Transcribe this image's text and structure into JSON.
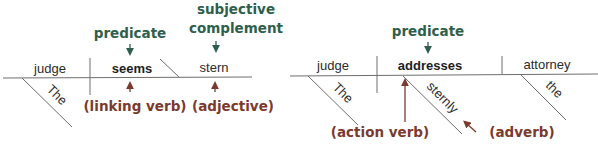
{
  "colors": {
    "label_green": "#2f5f4c",
    "label_red": "#7b3a2e",
    "diagram_line": "#6e6e6e",
    "word_text": "#2b2b2b"
  },
  "diagram_left": {
    "sentence": "The judge seems stern",
    "subject": "judge",
    "subject_modifier": "The",
    "verb": "seems",
    "complement": "stern",
    "labels": {
      "predicate": "predicate",
      "subjective_line1": "subjective",
      "subjective_line2": "complement",
      "linking_verb": "(linking verb)",
      "adjective": "(adjective)"
    }
  },
  "diagram_right": {
    "sentence": "The judge sternly addresses the attorney",
    "subject": "judge",
    "subject_modifier": "The",
    "verb": "addresses",
    "verb_modifier": "sternly",
    "object": "attorney",
    "object_modifier": "the",
    "labels": {
      "predicate": "predicate",
      "action_verb": "(action verb)",
      "adverb": "(adverb)"
    }
  }
}
